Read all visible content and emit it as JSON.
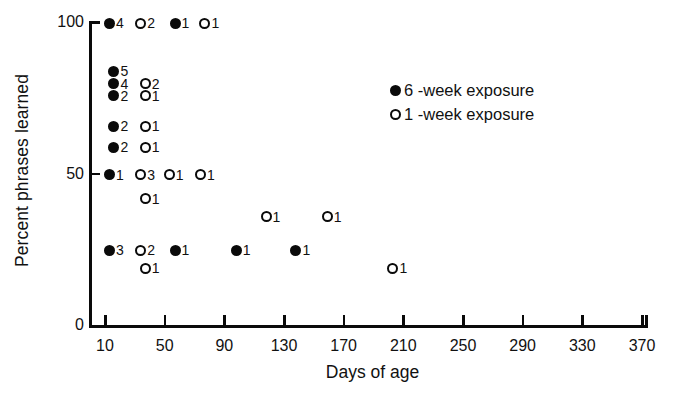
{
  "chart_data": {
    "type": "scatter",
    "title": "",
    "xlabel": "Days of age",
    "ylabel": "Percent phrases learned",
    "xlim": [
      0,
      380
    ],
    "ylim": [
      0,
      100
    ],
    "xticks": [
      10,
      50,
      90,
      130,
      170,
      210,
      250,
      290,
      330,
      370
    ],
    "xtick_labels": [
      "10",
      "50",
      "90",
      "130",
      "170",
      "210",
      "250",
      "290",
      "330",
      "370"
    ],
    "yticks": [
      0,
      50,
      100
    ],
    "ytick_labels": [
      "0",
      "50",
      "100"
    ],
    "grid": false,
    "legend_position": "upper right",
    "series": [
      {
        "name": "6 -week exposure",
        "marker": "filled-circle",
        "color": "#0a0a0a",
        "points": [
          {
            "x": 13,
            "y": 100,
            "count": "4"
          },
          {
            "x": 57,
            "y": 100,
            "count": "1"
          },
          {
            "x": 16,
            "y": 84,
            "count": "5"
          },
          {
            "x": 16,
            "y": 80,
            "count": "4"
          },
          {
            "x": 16,
            "y": 76,
            "count": "2"
          },
          {
            "x": 16,
            "y": 66,
            "count": "2"
          },
          {
            "x": 16,
            "y": 59,
            "count": "2"
          },
          {
            "x": 13,
            "y": 50,
            "count": "1"
          },
          {
            "x": 13,
            "y": 25,
            "count": "3"
          },
          {
            "x": 57,
            "y": 25,
            "count": "1"
          },
          {
            "x": 98,
            "y": 25,
            "count": "1"
          },
          {
            "x": 138,
            "y": 25,
            "count": "1"
          }
        ]
      },
      {
        "name": "1 -week exposure",
        "marker": "open-circle",
        "color": "#0a0a0a",
        "points": [
          {
            "x": 34,
            "y": 100,
            "count": "2"
          },
          {
            "x": 77,
            "y": 100,
            "count": "1"
          },
          {
            "x": 37,
            "y": 80,
            "count": "2"
          },
          {
            "x": 37,
            "y": 76,
            "count": "1"
          },
          {
            "x": 37,
            "y": 66,
            "count": "1"
          },
          {
            "x": 37,
            "y": 59,
            "count": "1"
          },
          {
            "x": 34,
            "y": 50,
            "count": "3"
          },
          {
            "x": 53,
            "y": 50,
            "count": "1"
          },
          {
            "x": 74,
            "y": 50,
            "count": "1"
          },
          {
            "x": 37,
            "y": 42,
            "count": "1"
          },
          {
            "x": 118,
            "y": 36,
            "count": "1"
          },
          {
            "x": 159,
            "y": 36,
            "count": "1"
          },
          {
            "x": 34,
            "y": 25,
            "count": "2"
          },
          {
            "x": 37,
            "y": 19,
            "count": "1"
          },
          {
            "x": 203,
            "y": 19,
            "count": "1"
          }
        ]
      }
    ]
  },
  "legend": {
    "entries": [
      {
        "marker": "filled-circle",
        "label": "6 -week exposure"
      },
      {
        "marker": "open-circle",
        "label": "1 -week exposure"
      }
    ]
  }
}
